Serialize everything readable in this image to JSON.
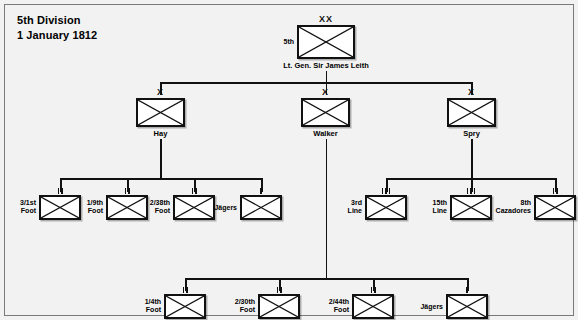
{
  "title": {
    "line1": "5th Division",
    "line2": "1 January 1812"
  },
  "division": {
    "designation": "5th",
    "echelon": "XX",
    "commander": "Lt. Gen. Sir James Leith"
  },
  "brigades": [
    {
      "name": "Hay",
      "echelon": "X"
    },
    {
      "name": "Walker",
      "echelon": "X"
    },
    {
      "name": "Spry",
      "echelon": "X"
    }
  ],
  "hay_units": [
    {
      "label_line1": "3/1st",
      "label_line2": "Foot",
      "echelon": "II"
    },
    {
      "label_line1": "1/9th",
      "label_line2": "Foot",
      "echelon": "II"
    },
    {
      "label_line1": "2/38th",
      "label_line2": "Foot",
      "echelon": "II"
    },
    {
      "label_line1": "Jägers",
      "label_line2": "",
      "echelon": "I"
    }
  ],
  "spry_units": [
    {
      "label_line1": "3rd",
      "label_line2": "Line",
      "echelon": "III"
    },
    {
      "label_line1": "15th",
      "label_line2": "Line",
      "echelon": "III"
    },
    {
      "label_line1": "8th",
      "label_line2": "Cazadores",
      "echelon": "II"
    }
  ],
  "walker_units": [
    {
      "label_line1": "1/4th",
      "label_line2": "Foot",
      "echelon": "II"
    },
    {
      "label_line1": "2/30th",
      "label_line2": "Foot",
      "echelon": "II"
    },
    {
      "label_line1": "2/44th",
      "label_line2": "Foot",
      "echelon": "II"
    },
    {
      "label_line1": "Jägers",
      "label_line2": "",
      "echelon": "I"
    }
  ],
  "colors": {
    "background": "#f2f2f2",
    "border": "#7a7a7a",
    "ink": "#111111",
    "box_fill": "#ffffff"
  }
}
